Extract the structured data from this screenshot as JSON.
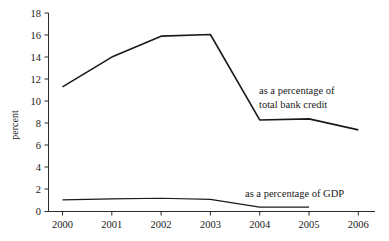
{
  "chart_data": {
    "type": "line",
    "title": "",
    "xlabel": "",
    "ylabel": "percent",
    "categories": [
      "2000",
      "2001",
      "2002",
      "2003",
      "2004",
      "2005",
      "2006"
    ],
    "x": [
      2000,
      2001,
      2002,
      2003,
      2004,
      2005,
      2006
    ],
    "xlim": [
      2000,
      2006
    ],
    "ylim": [
      0,
      18
    ],
    "y_ticks": [
      0,
      2,
      4,
      6,
      8,
      10,
      12,
      14,
      16,
      18
    ],
    "y_tick_labels": [
      "0",
      "2",
      "4",
      "6",
      "8",
      "10",
      "12",
      "14",
      "16",
      "18"
    ],
    "grid": false,
    "legend_position": "inline-annotation",
    "series": [
      {
        "name": "as a percentage of total bank credit",
        "values": [
          11.3,
          14.0,
          15.9,
          16.05,
          8.3,
          8.4,
          7.4
        ],
        "color": "#1a1a1a"
      },
      {
        "name": "as a percentage of GDP",
        "values": [
          1.05,
          1.15,
          1.2,
          1.1,
          0.4,
          0.4,
          null
        ],
        "color": "#1a1a1a"
      }
    ],
    "annotations": [
      {
        "id": "bank-credit-annotation",
        "lines": [
          "as a percentage of",
          "total bank credit"
        ],
        "x": 2004.0,
        "y": 10.2
      },
      {
        "id": "gdp-annotation",
        "lines": [
          "as a percentage of GDP"
        ],
        "x": 2004.0,
        "y": 1.55
      }
    ]
  },
  "axes": {
    "y_title": "percent",
    "y_tick_labels": [
      "18",
      "16",
      "14",
      "12",
      "10",
      "8",
      "6",
      "4",
      "2",
      "0"
    ],
    "x_tick_labels": [
      "2000",
      "2001",
      "2002",
      "2003",
      "2004",
      "2005",
      "2006"
    ]
  },
  "annotations": {
    "bank_credit_line1": "as a percentage of",
    "bank_credit_line2": "total bank credit",
    "gdp_line1": "as a percentage of GDP"
  },
  "colors": {
    "line": "#1a1a1a",
    "axis": "#2b2b2b",
    "background": "#ffffff"
  }
}
